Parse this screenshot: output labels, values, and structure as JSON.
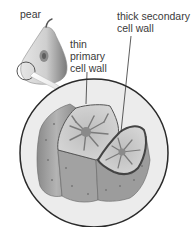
{
  "diagram": {
    "labels": {
      "pear": "pear",
      "thin_primary": [
        "thin",
        "primary",
        "cell wall"
      ],
      "thick_secondary": [
        "thick secondary",
        "cell wall"
      ]
    },
    "colors": {
      "outline": "#2a2a2a",
      "circle_fill": "#ececec",
      "cell_face": "#c9c9c9",
      "cell_side": "#9a9a9a",
      "cytoplasm": "#7c7c7c",
      "text": "#3a3a3a"
    }
  }
}
